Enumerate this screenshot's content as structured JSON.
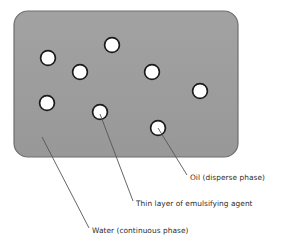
{
  "diagram": {
    "colors": {
      "continuous_phase_fill": "#9d9d9d",
      "continuous_phase_stroke": "#6e6e6e",
      "droplet_fill": "#ffffff",
      "droplet_stroke": "#1a1a1a",
      "leader_line": "#555555",
      "label_text": "#2b2b2b",
      "background": "#ffffff"
    },
    "matrix": {
      "name": "water-matrix",
      "x": 14,
      "y": 11,
      "width": 224,
      "height": 146,
      "corner_radius": 14
    },
    "droplets": [
      {
        "id": "droplet-1",
        "cx": 48,
        "cy": 58,
        "r": 7.4
      },
      {
        "id": "droplet-2",
        "cx": 80,
        "cy": 72,
        "r": 7.4
      },
      {
        "id": "droplet-3",
        "cx": 112,
        "cy": 45,
        "r": 7.4
      },
      {
        "id": "droplet-4",
        "cx": 152,
        "cy": 72,
        "r": 7.4
      },
      {
        "id": "droplet-5",
        "cx": 200,
        "cy": 91,
        "r": 7.4
      },
      {
        "id": "droplet-6",
        "cx": 47,
        "cy": 103,
        "r": 7.4
      },
      {
        "id": "droplet-7",
        "cx": 100,
        "cy": 112,
        "r": 7.4
      },
      {
        "id": "droplet-8",
        "cx": 158,
        "cy": 128,
        "r": 7.4
      }
    ],
    "callouts": [
      {
        "id": "callout-oil",
        "label": "Oil (disperse phase)",
        "label_x": 190,
        "label_y": 180,
        "leader": {
          "x1": 158,
          "y1": 128,
          "x2": 187,
          "y2": 175
        }
      },
      {
        "id": "callout-emulsifier",
        "label": "Thin layer of emulsifying agent",
        "label_x": 136,
        "label_y": 206,
        "leader": {
          "x1": 100,
          "y1": 114,
          "x2": 133,
          "y2": 201
        }
      },
      {
        "id": "callout-water",
        "label": "Water (continuous phase)",
        "label_x": 92,
        "label_y": 233,
        "leader": {
          "x1": 42,
          "y1": 137,
          "x2": 89,
          "y2": 228
        }
      }
    ]
  }
}
